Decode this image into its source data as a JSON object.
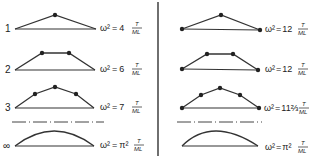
{
  "diagram": {
    "divider_color": "#333333",
    "left_panel": {
      "rows": [
        {
          "label": "1",
          "omega": "ω²",
          "eq": "=",
          "coef": "4",
          "num": "T",
          "den": "ML"
        },
        {
          "label": "2",
          "omega": "ω²",
          "eq": "=",
          "coef": "6",
          "num": "T",
          "den": "ML"
        },
        {
          "label": "3",
          "omega": "ω²",
          "eq": "=",
          "coef": "7",
          "num": "T",
          "den": "ML"
        },
        {
          "label": "∞",
          "omega": "ω²",
          "eq": "=",
          "coef": "π²",
          "num": "T",
          "den": "ML"
        }
      ]
    },
    "right_panel": {
      "rows": [
        {
          "omega": "ω²",
          "eq": "=",
          "coef": "12",
          "num": "T",
          "den": "ML"
        },
        {
          "omega": "ω²",
          "eq": "=",
          "coef": "12",
          "num": "T",
          "den": "ML"
        },
        {
          "omega": "ω²",
          "eq": "=",
          "coef": "11⅔",
          "num": "T",
          "den": "ML"
        },
        {
          "omega": "ω²",
          "eq": "=",
          "coef": "π²",
          "num": "T",
          "den": "ML"
        }
      ]
    }
  }
}
